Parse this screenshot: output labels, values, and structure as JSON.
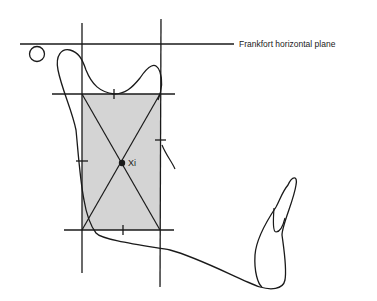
{
  "diagram": {
    "labels": {
      "frankfort": "Frankfort horizontal plane",
      "xi": "Xi"
    },
    "colors": {
      "line": "#1a1a1a",
      "rect_fill": "#d4d4d4",
      "background": "#ffffff"
    },
    "elements": [
      "Frankfort horizontal plane line",
      "porion circle",
      "mandible outline tracing",
      "ramus rectangle (shaded)",
      "rectangle diagonals",
      "Xi point",
      "incisor outline"
    ]
  }
}
